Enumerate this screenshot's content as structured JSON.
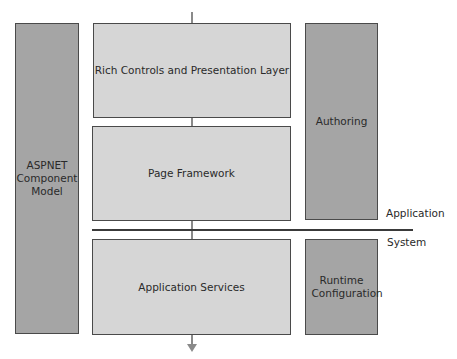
{
  "diagram": {
    "left_column": {
      "label": "ASPNET Component Model"
    },
    "center_stack": [
      {
        "label": "Rich Controls and Presentation Layer"
      },
      {
        "label": "Page Framework"
      },
      {
        "label": "Application Services"
      }
    ],
    "right_column": [
      {
        "label": "Authoring"
      },
      {
        "label": "Runtime Configuration"
      }
    ],
    "layer_labels": {
      "upper": "Application",
      "lower": "System"
    },
    "colors": {
      "light_box": "#d6d6d6",
      "dark_box": "#a5a5a5",
      "border": "#4a4a4a",
      "connector": "#8a8a8a"
    }
  }
}
